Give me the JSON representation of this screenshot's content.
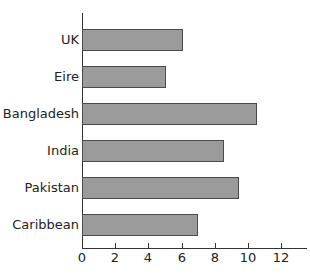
{
  "chart_data": {
    "type": "bar",
    "orientation": "horizontal",
    "title": "",
    "xlabel": "",
    "ylabel": "",
    "categories": [
      "UK",
      "Eire",
      "Bangladesh",
      "India",
      "Pakistan",
      "Caribbean"
    ],
    "values": [
      6.0,
      5.0,
      10.5,
      8.5,
      9.4,
      6.9
    ],
    "xlim": [
      0,
      13
    ],
    "x_ticks": [
      0,
      2,
      4,
      6,
      8,
      10,
      12
    ],
    "x_tick_labels": [
      "0",
      "2",
      "4",
      "6",
      "8",
      "10",
      "12"
    ],
    "grid": false,
    "legend": null,
    "colors": {
      "bar_fill": "#9b9b9b",
      "bar_outline": "#4a4a4a",
      "axis": "#333333"
    }
  },
  "labels": {
    "categories": [
      "UK",
      "Eire",
      "Bangladesh",
      "India",
      "Pakistan",
      "Caribbean"
    ],
    "ticks": [
      "0",
      "2",
      "4",
      "6",
      "8",
      "10",
      "12"
    ]
  }
}
